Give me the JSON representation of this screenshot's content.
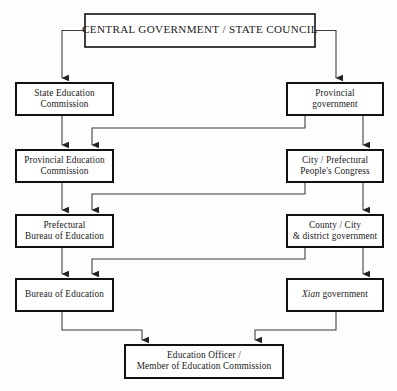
{
  "diagram": {
    "colors": {
      "background": "#fdfdfb",
      "box_fill": "#ffffff",
      "box_stroke": "#111111",
      "connector": "#3a3a3a",
      "text": "#1a1a1a"
    },
    "nodes": [
      {
        "id": "central-government",
        "lines": [
          "CENTRAL GOVERNMENT / STATE COUNCIL"
        ],
        "x": 85,
        "y": 14,
        "w": 230,
        "h": 33,
        "style": "title"
      },
      {
        "id": "state-education-commission",
        "lines": [
          "State Education",
          "Commission"
        ],
        "x": 16,
        "y": 83,
        "w": 97,
        "h": 32,
        "style": "normal"
      },
      {
        "id": "provincial-government",
        "lines": [
          "Provincial",
          "government"
        ],
        "x": 287,
        "y": 83,
        "w": 96,
        "h": 32,
        "style": "normal"
      },
      {
        "id": "provincial-education-commission",
        "lines": [
          "Provincial Education",
          "Commission"
        ],
        "x": 16,
        "y": 150,
        "w": 97,
        "h": 32,
        "style": "normal"
      },
      {
        "id": "city-prefectural-peoples-congress",
        "lines": [
          "City / Prefectural",
          "People's Congress"
        ],
        "x": 287,
        "y": 150,
        "w": 96,
        "h": 32,
        "style": "normal"
      },
      {
        "id": "prefectural-bureau-of-education",
        "lines": [
          "Prefectural",
          "Bureau of Education"
        ],
        "x": 16,
        "y": 215,
        "w": 97,
        "h": 32,
        "style": "normal"
      },
      {
        "id": "county-city-district-government",
        "lines": [
          "County / City",
          "& district government"
        ],
        "x": 287,
        "y": 215,
        "w": 96,
        "h": 32,
        "style": "normal"
      },
      {
        "id": "bureau-of-education",
        "lines": [
          "Bureau of Education"
        ],
        "x": 16,
        "y": 279,
        "w": 97,
        "h": 32,
        "style": "normal"
      },
      {
        "id": "xian-government",
        "lines": [
          "Xian government"
        ],
        "x": 287,
        "y": 279,
        "w": 96,
        "h": 32,
        "style": "italic-first-word"
      },
      {
        "id": "education-officer",
        "lines": [
          "Education Officer /",
          "Member of Education Commission"
        ],
        "x": 125,
        "y": 345,
        "w": 158,
        "h": 33,
        "style": "normal"
      }
    ],
    "connectors": [
      {
        "id": "central-to-state-education",
        "from": "central-government",
        "to": "state-education-commission",
        "path": "M 85 30.5 L 62 30.5 L 62 78"
      },
      {
        "id": "central-to-provincial-government",
        "from": "central-government",
        "to": "provincial-government",
        "path": "M 315 30.5 L 336 30.5 L 336 78"
      },
      {
        "id": "state-education-to-provincial-education",
        "from": "state-education-commission",
        "to": "provincial-education-commission",
        "path": "M 62 115 L 62 145"
      },
      {
        "id": "provincial-government-to-provincial-education",
        "from": "provincial-government",
        "to": "provincial-education-commission",
        "path": "M 305 115 L 305 128 L 92 128 L 92 145"
      },
      {
        "id": "provincial-government-to-city-congress",
        "from": "provincial-government",
        "to": "city-prefectural-peoples-congress",
        "path": "M 363 115 L 363 145"
      },
      {
        "id": "provincial-education-to-prefectural-bureau",
        "from": "provincial-education-commission",
        "to": "prefectural-bureau-of-education",
        "path": "M 62 182 L 62 210"
      },
      {
        "id": "city-congress-to-prefectural-bureau",
        "from": "city-prefectural-peoples-congress",
        "to": "prefectural-bureau-of-education",
        "path": "M 305 182 L 305 194 L 92 194 L 92 210"
      },
      {
        "id": "city-congress-to-county-district",
        "from": "city-prefectural-peoples-congress",
        "to": "county-city-district-government",
        "path": "M 363 182 L 363 210"
      },
      {
        "id": "prefectural-bureau-to-bureau",
        "from": "prefectural-bureau-of-education",
        "to": "bureau-of-education",
        "path": "M 62 247 L 62 274"
      },
      {
        "id": "county-district-to-bureau",
        "from": "county-city-district-government",
        "to": "bureau-of-education",
        "path": "M 305 247 L 305 259 L 92 259 L 92 274"
      },
      {
        "id": "county-district-to-xian",
        "from": "county-city-district-government",
        "to": "xian-government",
        "path": "M 363 247 L 363 274"
      },
      {
        "id": "bureau-to-education-officer",
        "from": "bureau-of-education",
        "to": "education-officer",
        "path": "M 62 311 L 62 330 L 142 330 L 142 340"
      },
      {
        "id": "xian-to-education-officer",
        "from": "xian-government",
        "to": "education-officer",
        "path": "M 336 311 L 336 330 L 255 330 L 255 340"
      }
    ]
  }
}
